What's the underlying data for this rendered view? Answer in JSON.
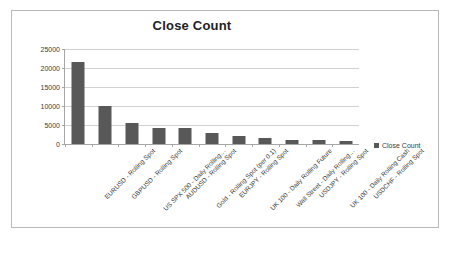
{
  "chart_data": {
    "type": "bar",
    "title": "Close Count",
    "xlabel": "",
    "ylabel": "",
    "ylim": [
      0,
      25000
    ],
    "yticks": [
      0,
      5000,
      10000,
      15000,
      20000,
      25000
    ],
    "ytick_labels": [
      "0",
      "5000",
      "10000",
      "15000",
      "20000",
      "25000"
    ],
    "grid": true,
    "legend_position": "right",
    "legend": [
      "Close Count"
    ],
    "series_name": "Close Count",
    "series_color": "#585858",
    "categories": [
      "EURUSD - Rolling Spot",
      "GBPUSD - Rolling Spot",
      "US SPX 500 - Daily Rolling…",
      "AUDUSD - Rolling Spot",
      "Gold - Rolling Spot (per 0.1)",
      "EURJPY - Rolling Spot",
      "UK 100 - Daily Rolling Future",
      "Wall Street - Daily Rolling…",
      "USDJPY - Rolling Spot",
      "UK 100 - Daily Rolling Cash",
      "USDCHF - Rolling Spot"
    ],
    "values": [
      21500,
      10000,
      5600,
      4100,
      4100,
      3000,
      2000,
      1600,
      1100,
      950,
      850
    ]
  }
}
